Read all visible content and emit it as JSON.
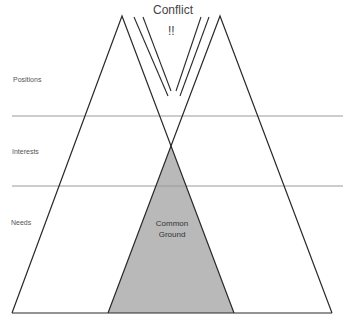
{
  "diagram": {
    "title": "Conflict",
    "exclamation": "!!",
    "levels": [
      {
        "label": "Positions"
      },
      {
        "label": "Interests"
      },
      {
        "label": "Needs"
      }
    ],
    "overlap_label_line1": "Common",
    "overlap_label_line2": "Ground",
    "colors": {
      "line": "#2a2a2a",
      "divider": "#9a9a9a",
      "overlap_fill": "#b9b9b9",
      "label_text": "#555555"
    }
  }
}
